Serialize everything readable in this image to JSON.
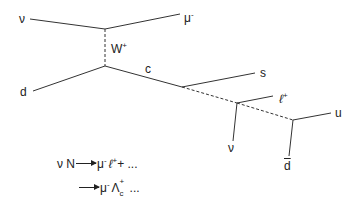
{
  "diagram": {
    "type": "feynman-diagram",
    "labels": {
      "nu_in": "ν",
      "mu_out": "μ",
      "mu_out_sup": "-",
      "w_boson": "W",
      "w_boson_sup": "+",
      "d_in": "d",
      "c_quark": "c",
      "s_quark": "s",
      "lepton": "ℓ",
      "lepton_sup": "+",
      "nu_out": "ν",
      "u_quark": "u",
      "dbar_quark": "d"
    },
    "reactions": {
      "line1_lhs": "ν N",
      "line1_rhs_mu": "μ",
      "line1_rhs_mu_sup": "-",
      "line1_rhs_l": "ℓ",
      "line1_rhs_l_sup": "+",
      "line1_tail": "+ ...",
      "line2_rhs_mu": "μ",
      "line2_rhs_mu_sup": "-",
      "line2_lambda": "Λ",
      "line2_lambda_sup": "+",
      "line2_lambda_sub": "c",
      "line2_tail": "..."
    },
    "colors": {
      "line": "#333333",
      "background": "#ffffff"
    }
  }
}
